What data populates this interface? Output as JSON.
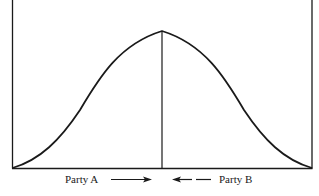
{
  "diagram": {
    "type": "bell-curve-negotiation",
    "curve": {
      "shape": "symmetric bell curve",
      "peak_position": "center",
      "description": "Distribution with vertical line at midpoint marking the convergence point"
    },
    "labels": {
      "party_a": "Party A",
      "party_b": "Party B"
    },
    "arrows": {
      "party_a_arrow": {
        "direction": "right",
        "style": "solid"
      },
      "party_b_arrow": {
        "direction": "left",
        "style": "dashed"
      }
    },
    "colors": {
      "line": "#1a1a1a",
      "background": "#ffffff"
    }
  }
}
